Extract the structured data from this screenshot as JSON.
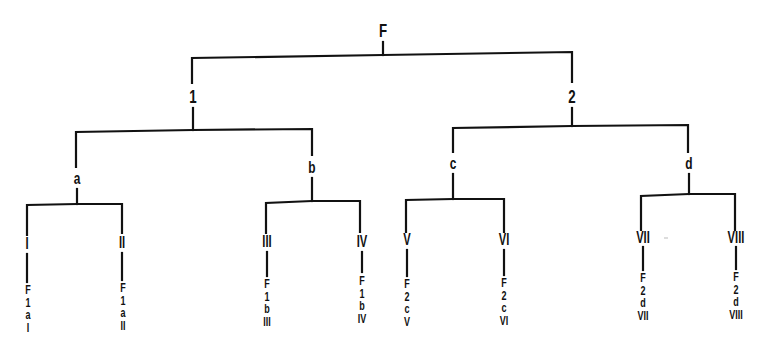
{
  "diagram": {
    "type": "hierarchical-tree",
    "line_color": "#111111",
    "background": "#ffffff",
    "root": {
      "label": "F",
      "children": [
        {
          "label": "1",
          "children": [
            {
              "label": "a",
              "children": [
                {
                  "label": "I",
                  "path": [
                    "F",
                    "1",
                    "a",
                    "I"
                  ]
                },
                {
                  "label": "II",
                  "path": [
                    "F",
                    "1",
                    "a",
                    "II"
                  ]
                }
              ]
            },
            {
              "label": "b",
              "children": [
                {
                  "label": "III",
                  "path": [
                    "F",
                    "1",
                    "b",
                    "III"
                  ]
                },
                {
                  "label": "IV",
                  "path": [
                    "F",
                    "1",
                    "b",
                    "IV"
                  ]
                }
              ]
            }
          ]
        },
        {
          "label": "2",
          "children": [
            {
              "label": "c",
              "children": [
                {
                  "label": "V",
                  "path": [
                    "F",
                    "2",
                    "c",
                    "V"
                  ]
                },
                {
                  "label": "VI",
                  "path": [
                    "F",
                    "2",
                    "c",
                    "VI"
                  ]
                }
              ]
            },
            {
              "label": "d",
              "children": [
                {
                  "label": "VII",
                  "path": [
                    "F",
                    "2",
                    "d",
                    "VII"
                  ]
                },
                {
                  "label": "VIII",
                  "path": [
                    "F",
                    "2",
                    "d",
                    "VIII"
                  ]
                }
              ]
            }
          ]
        }
      ]
    }
  },
  "labels": {
    "root": "F",
    "l1": [
      "1",
      "2"
    ],
    "l2": [
      "a",
      "b",
      "c",
      "d"
    ],
    "leaves": [
      "I",
      "II",
      "III",
      "IV",
      "V",
      "VI",
      "VII",
      "VIII"
    ]
  },
  "leaf_paths": [
    [
      "F",
      "1",
      "a",
      "I"
    ],
    [
      "F",
      "1",
      "a",
      "II"
    ],
    [
      "F",
      "1",
      "b",
      "III"
    ],
    [
      "F",
      "1",
      "b",
      "IV"
    ],
    [
      "F",
      "2",
      "c",
      "V"
    ],
    [
      "F",
      "2",
      "c",
      "VI"
    ],
    [
      "F",
      "2",
      "d",
      "VII"
    ],
    [
      "F",
      "2",
      "d",
      "VIII"
    ]
  ]
}
